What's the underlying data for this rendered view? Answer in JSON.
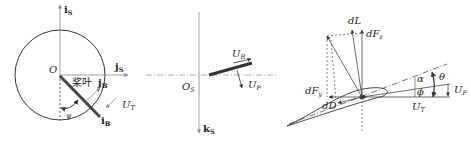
{
  "figure": {
    "panel_left": {
      "axis_up": {
        "main": "i",
        "sub": "S"
      },
      "axis_right": {
        "main": "j",
        "sub": "S"
      },
      "origin": "O",
      "blade_label": "桨叶",
      "blade_axis_j": {
        "main": "j",
        "sub": "B"
      },
      "blade_axis_i": {
        "main": "i",
        "sub": "B"
      },
      "azimuth": "ψ",
      "tangential_velocity": {
        "main": "U",
        "sub": "T"
      }
    },
    "panel_middle": {
      "origin": {
        "main": "O",
        "sub": "S"
      },
      "axis_down": {
        "main": "k",
        "sub": "S"
      },
      "radial_velocity": {
        "main": "U",
        "sub": "R"
      },
      "perpendicular_velocity": {
        "main": "U",
        "sub": "P"
      }
    },
    "panel_right": {
      "lift": "dL",
      "force_z": {
        "main": "dF",
        "sub": "z"
      },
      "force_y": {
        "main": "dF",
        "sub": "y"
      },
      "drag": "dD",
      "alpha": "α",
      "theta": "θ",
      "phi": "ϕ",
      "perpendicular_velocity": {
        "main": "U",
        "sub": "P"
      },
      "tangential_velocity": {
        "main": "U",
        "sub": "T"
      }
    }
  },
  "colors": {
    "stroke": "#333333",
    "light_stroke": "#888888",
    "blade": "#333333"
  }
}
